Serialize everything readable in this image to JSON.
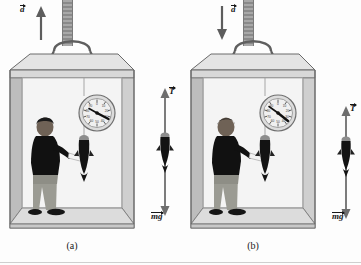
{
  "figure": {
    "type": "physics-diagram",
    "panels": [
      {
        "id": "a",
        "caption": "(a)",
        "acceleration": {
          "label": "a",
          "direction": "up",
          "arrow_glyph": "arrow-up"
        },
        "scale": {
          "name": "spring-scale-dial",
          "reading_direction": "high",
          "needle_angle_deg": 125,
          "tick_numbers": [
            "0",
            "10",
            "20",
            "30",
            "40",
            "50",
            "60",
            "70",
            "80",
            "90"
          ]
        },
        "hanging_object": "fish",
        "person": "passenger-with-clipboard",
        "free_body": {
          "tension": {
            "label": "mg",
            "symbol_main": "T",
            "direction": "up",
            "magnitude_px": 96
          },
          "weight": {
            "label": "mg",
            "symbol_main": "mg",
            "direction": "down",
            "magnitude_px": 78
          },
          "tension_label": "T",
          "weight_label": "mg"
        }
      },
      {
        "id": "b",
        "caption": "(b)",
        "acceleration": {
          "label": "a",
          "direction": "down",
          "arrow_glyph": "arrow-down"
        },
        "scale": {
          "name": "spring-scale-dial",
          "reading_direction": "low",
          "needle_angle_deg": 150,
          "tick_numbers": [
            "0",
            "10",
            "20",
            "30",
            "40",
            "50",
            "60",
            "70",
            "80",
            "90"
          ]
        },
        "hanging_object": "fish",
        "person": "passenger-with-clipboard",
        "free_body": {
          "tension": {
            "label": "T",
            "symbol_main": "T",
            "direction": "up",
            "magnitude_px": 62
          },
          "weight": {
            "label": "mg",
            "symbol_main": "mg",
            "direction": "down",
            "magnitude_px": 92
          },
          "tension_label": "T",
          "weight_label": "mg"
        }
      }
    ]
  },
  "colors": {
    "page_background": "#fdfdfd",
    "box_face_light": "#e9e9e9",
    "box_face_mid": "#d2d2d2",
    "box_face_dark": "#b4b4b4",
    "box_interior": "#f2f2f2",
    "outline": "#4a4a4a",
    "arrow": "#6e6e6e",
    "ink": "#171717",
    "cable": "#9a9a9a"
  }
}
